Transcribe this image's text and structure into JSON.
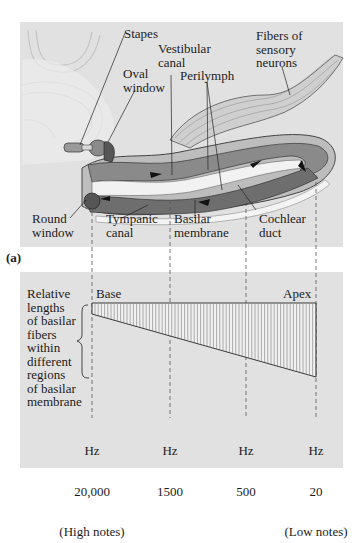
{
  "figure": {
    "panel_label": "(a)",
    "top_panel": {
      "title": "Cochlea anatomy (uncoiled)",
      "labels": {
        "stapes": "Stapes",
        "oval_window": "Oval\nwindow",
        "vestibular_canal": "Vestibular\ncanal",
        "perilymph": "Perilymph",
        "fibers": "Fibers of\nsensory\nneurons",
        "round_window": "Round\nwindow",
        "tympanic_canal": "Tympanic\ncanal",
        "basilar_membrane": "Basilar\nmembrane",
        "cochlear_duct": "Cochlear\nduct"
      }
    },
    "bottom_panel": {
      "y_description": "Relative\nlengths\nof basilar\nfibers\nwithin\ndifferent\nregions\nof basilar\nmembrane",
      "base_label": "Base",
      "apex_label": "Apex",
      "frequency_ticks": [
        {
          "unit": "Hz",
          "value": "20,000",
          "note": "(High notes)"
        },
        {
          "unit": "Hz",
          "value": "1500",
          "note": ""
        },
        {
          "unit": "Hz",
          "value": "500",
          "note": ""
        },
        {
          "unit": "Hz",
          "value": "20",
          "note": "(Low notes)"
        }
      ]
    }
  },
  "colors": {
    "panel_bg": "#e1e1e1",
    "canal_dark": "#6e6e6e",
    "canal_mid": "#9a9a9a",
    "membrane_light": "#f2f2f2",
    "line": "#2a2a2a"
  }
}
